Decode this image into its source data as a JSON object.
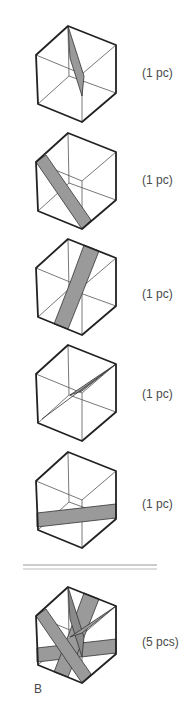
{
  "items": [
    {
      "label": "(1 pc)",
      "piece": "thin-vertical-sliver"
    },
    {
      "label": "(1 pc)",
      "piece": "diagonal-band-left-to-bottom"
    },
    {
      "label": "(1 pc)",
      "piece": "diagonal-band-top-to-bottom-left"
    },
    {
      "label": "(1 pc)",
      "piece": "thin-diagonal-sliver"
    },
    {
      "label": "(1 pc)",
      "piece": "horizontal-band"
    }
  ],
  "assembly": {
    "label": "(5 pcs)",
    "tag": "B"
  },
  "colors": {
    "edge": "#222222",
    "inner_edge": "#555555",
    "band_fill": "#9a9a9a",
    "divider": "#999999"
  }
}
